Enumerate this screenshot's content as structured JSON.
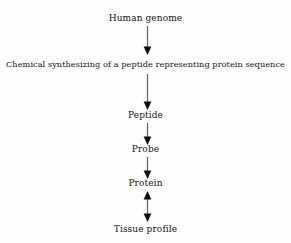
{
  "diagram": {
    "background_color": "#fefefe",
    "text_color": "#131313",
    "arrow_color": "#5c5c5c",
    "arrowhead_color": "#0d0d0d",
    "orientation": "top-to-bottom",
    "nodes": [
      {
        "id": "human-genome",
        "label": "Human genome"
      },
      {
        "id": "chemical-synthesizing",
        "label": "Chemical synthesizing of a peptide representing protein sequence"
      },
      {
        "id": "peptide",
        "label": "Peptide"
      },
      {
        "id": "probe",
        "label": "Probe"
      },
      {
        "id": "protein",
        "label": "Protein"
      },
      {
        "id": "tissue-profile",
        "label": "Tissue profile"
      }
    ],
    "edges": [
      {
        "id": "edge-1",
        "from": "human-genome",
        "to": "chemical-synthesizing",
        "direction": "down"
      },
      {
        "id": "edge-2",
        "from": "chemical-synthesizing",
        "to": "peptide",
        "direction": "down"
      },
      {
        "id": "edge-3",
        "from": "peptide",
        "to": "probe",
        "direction": "down"
      },
      {
        "id": "edge-4",
        "from": "probe",
        "to": "protein",
        "direction": "down"
      },
      {
        "id": "edge-5",
        "from": "protein",
        "to": "tissue-profile",
        "direction": "bidirectional"
      }
    ]
  }
}
